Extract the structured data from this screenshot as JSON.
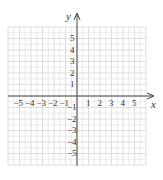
{
  "diagram": {
    "type": "coordinate-plane",
    "x_axis": {
      "label": "x",
      "ticks": [
        "−5",
        "−4",
        "−3",
        "−2",
        "−1",
        "1",
        "2",
        "3",
        "4",
        "5"
      ],
      "tick_values": [
        -5,
        -4,
        -3,
        -2,
        -1,
        1,
        2,
        3,
        4,
        5
      ],
      "range": [
        -6,
        6
      ]
    },
    "y_axis": {
      "label": "y",
      "ticks": [
        "5",
        "4",
        "3",
        "2",
        "1",
        "−1",
        "−2",
        "−3",
        "−4",
        "−5"
      ],
      "tick_values": [
        5,
        4,
        3,
        2,
        1,
        -1,
        -2,
        -3,
        -4,
        -5
      ],
      "range": [
        -6,
        6
      ]
    },
    "grid": {
      "minor_color": "#e4e4e4",
      "major_color": "#d6d6d6",
      "axis_color": "#444444"
    }
  }
}
